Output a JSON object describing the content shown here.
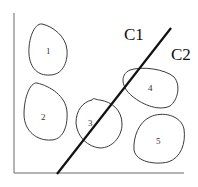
{
  "diagram": {
    "title": "",
    "lines": [
      {
        "id": "C1",
        "label": "C1"
      },
      {
        "id": "C2",
        "label": "C2"
      }
    ],
    "clusters": [
      {
        "id": 1,
        "label": "1"
      },
      {
        "id": 2,
        "label": "2"
      },
      {
        "id": 3,
        "label": "3"
      },
      {
        "id": 4,
        "label": "4"
      },
      {
        "id": 5,
        "label": "5"
      }
    ]
  }
}
